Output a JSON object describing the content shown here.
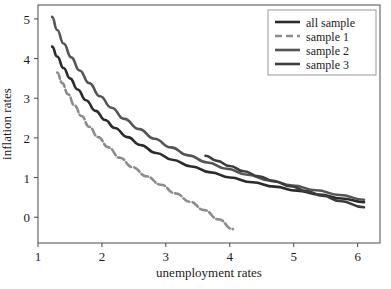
{
  "chart_data": {
    "type": "scatter",
    "title": "",
    "xlabel": "unemployment rates",
    "ylabel": "inflation rates",
    "xlim": [
      1.0,
      6.35
    ],
    "ylim": [
      -0.65,
      5.35
    ],
    "xticks": [
      "1",
      "2",
      "3",
      "4",
      "5",
      "6"
    ],
    "xtick_values": [
      1,
      2,
      3,
      4,
      5,
      6
    ],
    "yticks": [
      "0",
      "1",
      "2",
      "3",
      "4",
      "5"
    ],
    "ytick_values": [
      0,
      1,
      2,
      3,
      4,
      5
    ],
    "grid": false,
    "legend_position": "upper right",
    "series": [
      {
        "name": "all sample",
        "color": "#2b2b2b",
        "linestyle": "solid",
        "linewidth": 2.6,
        "x": [
          1.22,
          1.3,
          1.4,
          1.5,
          1.62,
          1.75,
          1.9,
          2.05,
          2.2,
          2.4,
          2.6,
          2.85,
          3.1,
          3.4,
          3.7,
          4.0,
          4.35,
          4.7,
          5.05,
          5.4,
          5.75,
          6.1
        ],
        "y": [
          4.3,
          4.05,
          3.76,
          3.5,
          3.22,
          2.95,
          2.68,
          2.45,
          2.25,
          2.02,
          1.82,
          1.62,
          1.45,
          1.28,
          1.13,
          1.0,
          0.88,
          0.77,
          0.67,
          0.57,
          0.47,
          0.38
        ]
      },
      {
        "name": "sample 1",
        "color": "#8c8c8c",
        "linestyle": "dashed",
        "linewidth": 2.6,
        "x": [
          1.3,
          1.38,
          1.47,
          1.57,
          1.68,
          1.8,
          1.94,
          2.1,
          2.28,
          2.48,
          2.7,
          2.92,
          3.15,
          3.38,
          3.6,
          3.82,
          4.05
        ],
        "y": [
          3.65,
          3.38,
          3.1,
          2.82,
          2.55,
          2.28,
          2.02,
          1.76,
          1.5,
          1.26,
          1.03,
          0.82,
          0.6,
          0.39,
          0.18,
          -0.05,
          -0.3
        ]
      },
      {
        "name": "sample 2",
        "color": "#555555",
        "linestyle": "solid",
        "linewidth": 2.6,
        "x": [
          1.22,
          1.3,
          1.4,
          1.52,
          1.65,
          1.8,
          1.97,
          2.15,
          2.35,
          2.58,
          2.82,
          3.08,
          3.35,
          3.65,
          3.95,
          4.28,
          4.62,
          4.98,
          5.35,
          5.72,
          6.1
        ],
        "y": [
          5.05,
          4.72,
          4.38,
          4.03,
          3.7,
          3.38,
          3.05,
          2.76,
          2.48,
          2.22,
          1.98,
          1.76,
          1.56,
          1.38,
          1.22,
          1.07,
          0.93,
          0.8,
          0.68,
          0.56,
          0.44
        ]
      },
      {
        "name": "sample 3",
        "color": "#3d3d3d",
        "linestyle": "solid",
        "linewidth": 2.6,
        "x": [
          3.62,
          3.8,
          4.0,
          4.22,
          4.45,
          4.7,
          4.95,
          5.2,
          5.45,
          5.72,
          6.1
        ],
        "y": [
          1.55,
          1.42,
          1.29,
          1.16,
          1.03,
          0.9,
          0.78,
          0.66,
          0.54,
          0.41,
          0.25
        ]
      }
    ]
  },
  "legend": {
    "entries": [
      {
        "label": "all sample"
      },
      {
        "label": "sample 1"
      },
      {
        "label": "sample 2"
      },
      {
        "label": "sample 3"
      }
    ]
  },
  "caption": {
    "text": ""
  }
}
